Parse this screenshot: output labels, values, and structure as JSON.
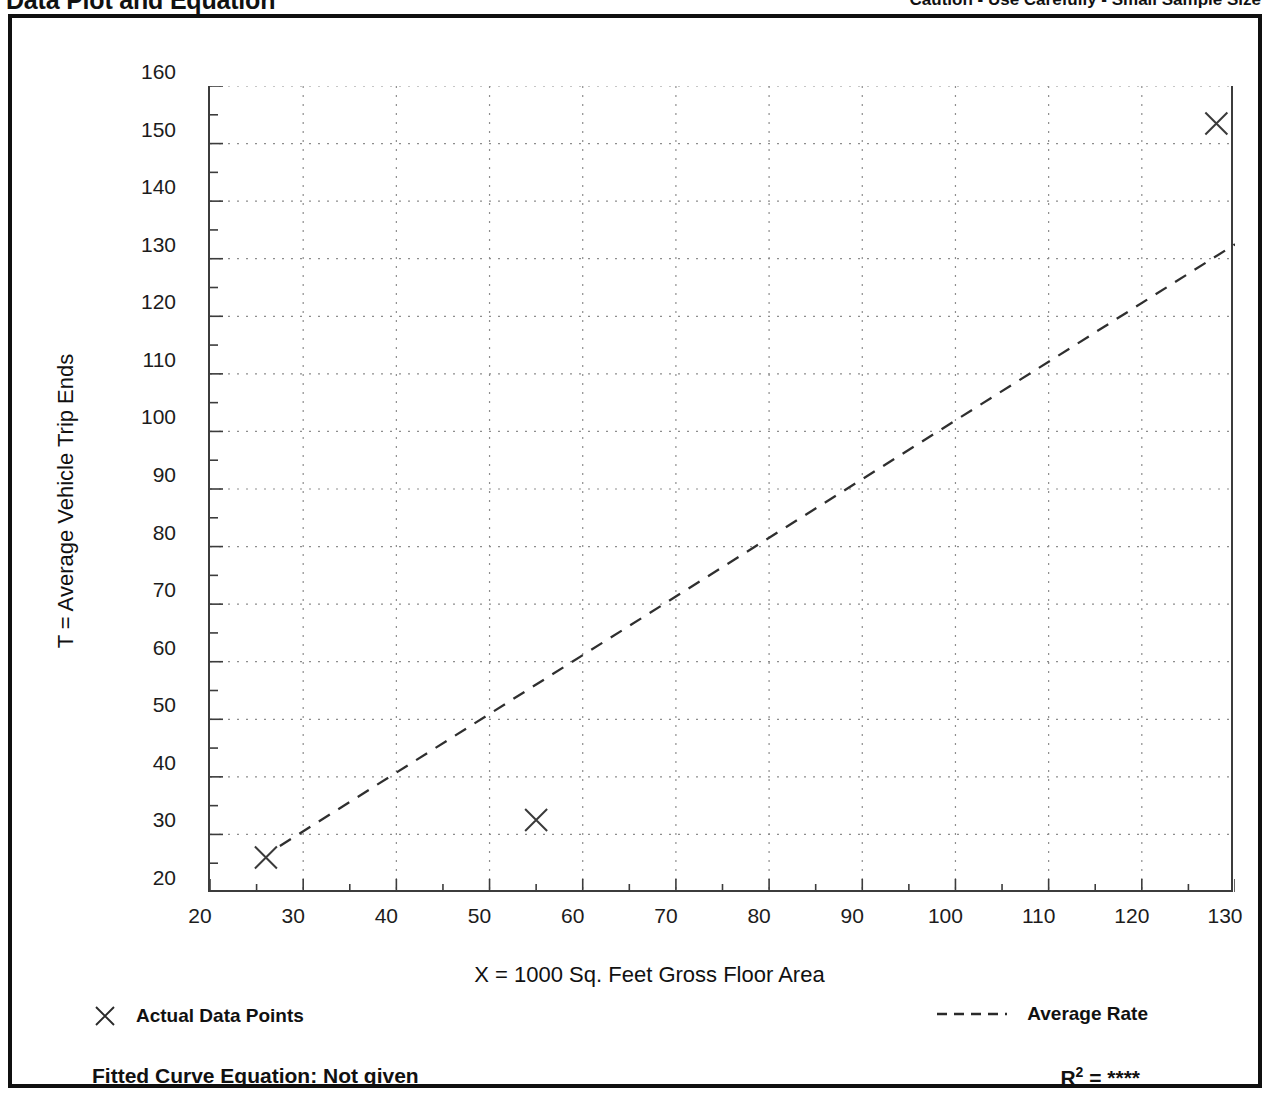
{
  "header": {
    "title": "Data Plot and Equation",
    "caution": "Caution - Use Carefully - Small Sample Size"
  },
  "legend": {
    "data_points_label": "Actual Data Points",
    "average_rate_label": "Average Rate",
    "marker_icon": "x-marker-icon",
    "line_icon": "dashed-line-icon"
  },
  "footer": {
    "equation_label": "Fitted Curve Equation:  Not given",
    "r2_prefix": "R",
    "r2_exponent": "2",
    "r2_equals": " = ",
    "r2_value": "****"
  },
  "chart_data": {
    "type": "scatter",
    "title": "Data Plot and Equation",
    "xlabel": "X = 1000 Sq. Feet Gross Floor Area",
    "ylabel": "T = Average Vehicle Trip Ends",
    "xlim": [
      20,
      130
    ],
    "ylim": [
      20,
      160
    ],
    "xticks": [
      20,
      30,
      40,
      50,
      60,
      70,
      80,
      90,
      100,
      110,
      120,
      130
    ],
    "yticks": [
      20,
      30,
      40,
      50,
      60,
      70,
      80,
      90,
      100,
      110,
      120,
      130,
      140,
      150,
      160
    ],
    "x_minor_step": 5,
    "y_minor_step": 5,
    "grid": true,
    "grid_style": "dotted",
    "legend_position": "below-axes",
    "series": [
      {
        "name": "Actual Data Points",
        "type": "scatter",
        "marker": "x",
        "points": [
          {
            "x": 26,
            "y": 26
          },
          {
            "x": 55,
            "y": 32.5
          },
          {
            "x": 128,
            "y": 153.5
          }
        ]
      },
      {
        "name": "Average Rate",
        "type": "line",
        "style": "dashed",
        "slope": 1.0196,
        "intercept": 0,
        "endpoints": [
          {
            "x": 27.5,
            "y": 28
          },
          {
            "x": 130,
            "y": 132.5
          }
        ]
      }
    ]
  }
}
